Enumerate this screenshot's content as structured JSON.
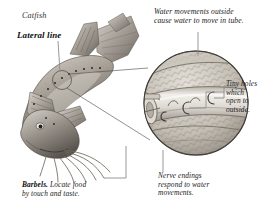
{
  "figure": {
    "labels": {
      "catfish": "Catfish",
      "lateral_line": "Lateral line"
    },
    "annotations": {
      "water_movements": "Water movements outside\ncause water to move in tube.",
      "tiny_holes": "Tiny holes\nwhich\nopen to\noutside.",
      "nerve_endings": "Nerve endings\nrespond to water\nmovements.",
      "barbels_lead": "Barbels.",
      "barbels_rest": " Locate food\nby touch and taste."
    },
    "colors": {
      "ink": "#1b1b1b",
      "leader": "#8c8c8c",
      "scale_light": "#d8d4cd",
      "scale_mid": "#b3aea6",
      "scale_dark": "#7d776e",
      "tube_light": "#e6e3de",
      "tube_shadow": "#9a948b",
      "fish_light": "#cfcac2",
      "fish_mid": "#9b958c",
      "fish_dark": "#5d5851",
      "background": "#ffffff"
    }
  }
}
